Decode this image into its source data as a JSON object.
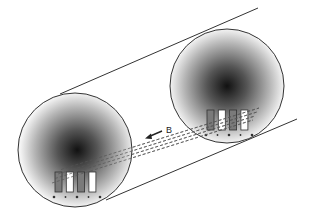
{
  "diagram": {
    "field_label": "B",
    "field_arrow": "arrow-left-down",
    "colors": {
      "outline": "#333333",
      "gradient_center": "#111111",
      "gradient_edge": "#f4f4f4",
      "strip_dark": "#7a7a7a",
      "strip_light": "#ffffff",
      "dash_line": "#555555"
    },
    "cross_sections": [
      {
        "id": "near",
        "strips": [
          "dark",
          "light",
          "dark",
          "light"
        ],
        "terminals": [
          "+",
          "-",
          "+",
          "-",
          "+"
        ]
      },
      {
        "id": "far",
        "strips": [
          "dark",
          "light",
          "dark",
          "light"
        ],
        "terminals": [
          "+",
          "-",
          "+",
          "-",
          "+"
        ]
      }
    ],
    "connecting_lines": 4
  }
}
